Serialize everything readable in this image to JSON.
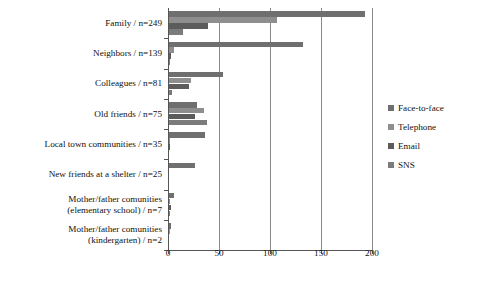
{
  "chart_data": {
    "type": "bar",
    "orientation": "horizontal",
    "title": "",
    "xlabel": "",
    "ylabel": "",
    "xlim": [
      0,
      200
    ],
    "xticks": [
      0,
      50,
      100,
      150,
      200
    ],
    "xtick_labels": [
      "0",
      "50",
      "100",
      "150",
      "200"
    ],
    "grid": true,
    "legend_position": "right",
    "categories": [
      "Family / n=249",
      "Neighbors / n=139",
      "Colleagues / n=81",
      "Old friends / n=75",
      "Local town communities / n=35",
      "New friends at a shelter / n=25",
      "Mother/father comunities\n(elementary school) / n=7",
      "Mother/father comunities\n(kindergarten) / n=2"
    ],
    "series": [
      {
        "name": "Face-to-face",
        "color": "#6f6f6f",
        "values": [
          192,
          131,
          53,
          27,
          35,
          25,
          5,
          2
        ]
      },
      {
        "name": "Telephone",
        "color": "#8e8e8e",
        "values": [
          106,
          5,
          22,
          34,
          1,
          0,
          1,
          1
        ]
      },
      {
        "name": "Email",
        "color": "#5c5c5c",
        "values": [
          38,
          2,
          20,
          25,
          1,
          0,
          2,
          0
        ]
      },
      {
        "name": "SNS",
        "color": "#7b7b7b",
        "values": [
          14,
          1,
          3,
          37,
          0,
          0,
          1,
          0
        ]
      }
    ]
  }
}
